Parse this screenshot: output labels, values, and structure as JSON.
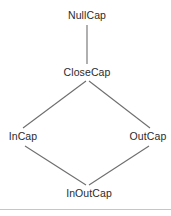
{
  "diagram": {
    "type": "lattice-hasse-diagram",
    "nodes": [
      {
        "id": "nullcap",
        "label": "NullCap",
        "x": 87,
        "y": 16
      },
      {
        "id": "closecap",
        "label": "CloseCap",
        "x": 87,
        "y": 73
      },
      {
        "id": "incap",
        "label": "InCap",
        "x": 22,
        "y": 137
      },
      {
        "id": "outcap",
        "label": "OutCap",
        "x": 147,
        "y": 137
      },
      {
        "id": "inoutcap",
        "label": "InOutCap",
        "x": 88,
        "y": 194
      }
    ],
    "edges": [
      {
        "from": "nullcap",
        "to": "closecap"
      },
      {
        "from": "closecap",
        "to": "incap"
      },
      {
        "from": "closecap",
        "to": "outcap"
      },
      {
        "from": "incap",
        "to": "inoutcap"
      },
      {
        "from": "outcap",
        "to": "inoutcap"
      }
    ],
    "colors": {
      "line": "#6e6e6e",
      "text": "#2b2b2b",
      "background": "#ffffff",
      "rule": "#c6c6c6"
    }
  }
}
